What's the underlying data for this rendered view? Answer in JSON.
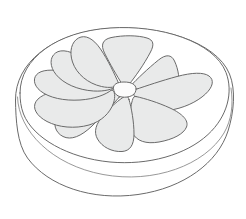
{
  "illustration": {
    "title": "Halved citrus fruit line drawing",
    "subject": "lemon-half-cut-face",
    "view": "three-quarter perspective, cut face up",
    "style": "line art, outlined, flat light-gray fill",
    "canvas": {
      "width": 246,
      "height": 219
    },
    "colors": {
      "background": "#ffffff",
      "outline": "#6a6a6a",
      "outline_soft": "#8c8c8c",
      "segment_fill": "#e9eaea",
      "rind_fill": "#ffffff",
      "pith_fill": "#ffffff",
      "core_fill": "#fcfcfc"
    },
    "stroke_widths": {
      "outer_rind": 1.0,
      "inner_rind": 0.9,
      "pulp_edge": 1.0,
      "segment": 1.0,
      "core": 1.0
    },
    "parts": [
      {
        "name": "outer-rind-outline",
        "label": "Outer rind silhouette"
      },
      {
        "name": "rind-depth-band",
        "label": "Rind depth band"
      },
      {
        "name": "pith-ring",
        "label": "White pith ring"
      },
      {
        "name": "pulp-disc",
        "label": "Cut pulp face"
      },
      {
        "name": "segments",
        "label": "Citrus segments"
      },
      {
        "name": "core-hub",
        "label": "Central core"
      }
    ],
    "geometry": {
      "outer_ellipse": {
        "cx": 123,
        "cy": 112,
        "rx": 110,
        "ry": 94
      },
      "rind_band_ellipse": {
        "cx": 122,
        "cy": 106,
        "rx": 107,
        "ry": 90
      },
      "pith_ellipse": {
        "cx": 122,
        "cy": 99,
        "rx": 104,
        "ry": 86
      },
      "pulp_ellipse": {
        "cx": 122,
        "cy": 97,
        "rx": 92,
        "ry": 77
      },
      "core": {
        "cx": 124,
        "cy": 92,
        "rx": 12,
        "ry": 9
      }
    },
    "segment_count": 10,
    "segments": [
      {
        "id": 1,
        "name": "segment-top",
        "angle_deg": 268
      },
      {
        "id": 2,
        "name": "segment-top-right",
        "angle_deg": 308
      },
      {
        "id": 3,
        "name": "segment-right-upper",
        "angle_deg": 344
      },
      {
        "id": 4,
        "name": "segment-right",
        "angle_deg": 14
      },
      {
        "id": 5,
        "name": "segment-right-lower",
        "angle_deg": 46
      },
      {
        "id": 6,
        "name": "segment-bottom-right",
        "angle_deg": 80
      },
      {
        "id": 7,
        "name": "segment-bottom-left",
        "angle_deg": 112
      },
      {
        "id": 8,
        "name": "segment-left-lower",
        "angle_deg": 152
      },
      {
        "id": 9,
        "name": "segment-left",
        "angle_deg": 192
      },
      {
        "id": 10,
        "name": "segment-top-left",
        "angle_deg": 228
      }
    ]
  }
}
